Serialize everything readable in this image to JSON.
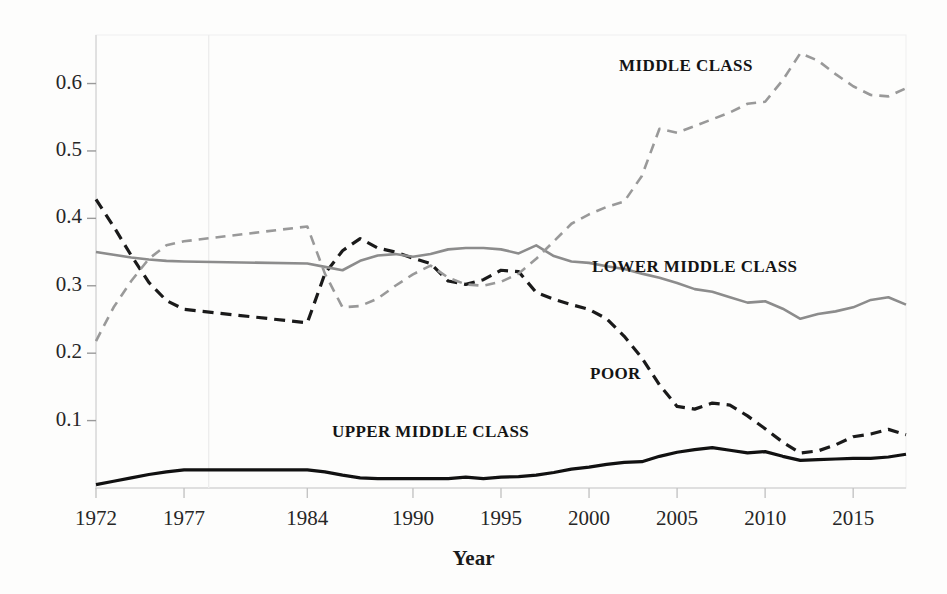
{
  "chart_data": {
    "type": "line",
    "title": "",
    "subtitle": "",
    "xlabel": "Year",
    "ylabel": "",
    "xlim": [
      1972,
      2018
    ],
    "ylim": [
      0.0,
      0.672
    ],
    "grid": false,
    "legend_position": "inline-annotations",
    "x_ticks": [
      1972,
      1977,
      1984,
      1990,
      1995,
      2000,
      2005,
      2010,
      2015
    ],
    "y_ticks": [
      0.1,
      0.2,
      0.3,
      0.4,
      0.5,
      0.6
    ],
    "y_tick_labels": [
      "0.1",
      "0.2",
      "0.3",
      "0.4",
      "0.5",
      "0.6"
    ],
    "x_tick_labels": [
      "1972",
      "1977",
      "1984",
      "1990",
      "1995",
      "2000",
      "2005",
      "2010",
      "2015"
    ],
    "annotations": [
      {
        "text": "MIDDLE CLASS",
        "x": 2005.5,
        "y": 0.625
      },
      {
        "text": "LOWER MIDDLE CLASS",
        "x": 2006.0,
        "y": 0.327
      },
      {
        "text": "POOR",
        "x": 2001.5,
        "y": 0.168
      },
      {
        "text": "UPPER MIDDLE CLASS",
        "x": 1991.0,
        "y": 0.082
      }
    ],
    "series": [
      {
        "name": "POOR",
        "color": "#1a1a1a",
        "style": "dashed",
        "width": 3.2,
        "x": [
          1972,
          1973,
          1974,
          1975,
          1976,
          1977,
          1984,
          1985,
          1986,
          1987,
          1988,
          1989,
          1990,
          1991,
          1992,
          1993,
          1994,
          1995,
          1996,
          1997,
          1998,
          1999,
          2000,
          2001,
          2002,
          2003,
          2004,
          2005,
          2006,
          2007,
          2008,
          2009,
          2010,
          2011,
          2012,
          2013,
          2014,
          2015,
          2016,
          2017,
          2018
        ],
        "values": [
          0.428,
          0.388,
          0.345,
          0.305,
          0.278,
          0.265,
          0.245,
          0.318,
          0.352,
          0.37,
          0.356,
          0.35,
          0.341,
          0.333,
          0.307,
          0.302,
          0.309,
          0.323,
          0.321,
          0.29,
          0.28,
          0.272,
          0.265,
          0.251,
          0.225,
          0.193,
          0.153,
          0.121,
          0.117,
          0.126,
          0.123,
          0.107,
          0.088,
          0.068,
          0.052,
          0.055,
          0.064,
          0.076,
          0.08,
          0.087,
          0.079
        ]
      },
      {
        "name": "LOWER MIDDLE CLASS",
        "color": "#8c8c8c",
        "style": "solid",
        "width": 2.6,
        "x": [
          1972,
          1973,
          1974,
          1975,
          1976,
          1977,
          1984,
          1985,
          1986,
          1987,
          1988,
          1989,
          1990,
          1991,
          1992,
          1993,
          1994,
          1995,
          1996,
          1997,
          1998,
          1999,
          2000,
          2001,
          2002,
          2003,
          2004,
          2005,
          2006,
          2007,
          2008,
          2009,
          2010,
          2011,
          2012,
          2013,
          2014,
          2015,
          2016,
          2017,
          2018
        ],
        "values": [
          0.35,
          0.346,
          0.342,
          0.339,
          0.337,
          0.336,
          0.333,
          0.328,
          0.323,
          0.337,
          0.345,
          0.347,
          0.343,
          0.347,
          0.354,
          0.356,
          0.356,
          0.354,
          0.348,
          0.36,
          0.344,
          0.336,
          0.334,
          0.329,
          0.325,
          0.318,
          0.312,
          0.304,
          0.295,
          0.291,
          0.283,
          0.275,
          0.277,
          0.266,
          0.251,
          0.258,
          0.262,
          0.268,
          0.279,
          0.283,
          0.272
        ]
      },
      {
        "name": "MIDDLE CLASS",
        "color": "#999999",
        "style": "dashed",
        "width": 2.6,
        "x": [
          1972,
          1973,
          1974,
          1975,
          1976,
          1977,
          1984,
          1985,
          1986,
          1987,
          1988,
          1989,
          1990,
          1991,
          1992,
          1993,
          1994,
          1995,
          1996,
          1997,
          1998,
          1999,
          2000,
          2001,
          2002,
          2003,
          2004,
          2005,
          2006,
          2007,
          2008,
          2009,
          2010,
          2011,
          2012,
          2013,
          2014,
          2015,
          2016,
          2017,
          2018
        ],
        "values": [
          0.218,
          0.268,
          0.307,
          0.34,
          0.36,
          0.366,
          0.388,
          0.318,
          0.268,
          0.27,
          0.281,
          0.3,
          0.317,
          0.33,
          0.312,
          0.302,
          0.3,
          0.306,
          0.318,
          0.34,
          0.366,
          0.392,
          0.406,
          0.417,
          0.425,
          0.463,
          0.533,
          0.527,
          0.537,
          0.547,
          0.557,
          0.57,
          0.573,
          0.605,
          0.645,
          0.634,
          0.614,
          0.596,
          0.583,
          0.581,
          0.593
        ]
      },
      {
        "name": "UPPER MIDDLE CLASS",
        "color": "#111111",
        "style": "solid",
        "width": 3.2,
        "x": [
          1972,
          1973,
          1974,
          1975,
          1976,
          1977,
          1984,
          1985,
          1986,
          1987,
          1988,
          1989,
          1990,
          1991,
          1992,
          1993,
          1994,
          1995,
          1996,
          1997,
          1998,
          1999,
          2000,
          2001,
          2002,
          2003,
          2004,
          2005,
          2006,
          2007,
          2008,
          2009,
          2010,
          2011,
          2012,
          2013,
          2014,
          2015,
          2016,
          2017,
          2018
        ],
        "values": [
          0.005,
          0.01,
          0.015,
          0.02,
          0.024,
          0.027,
          0.027,
          0.024,
          0.019,
          0.015,
          0.014,
          0.014,
          0.014,
          0.014,
          0.014,
          0.016,
          0.014,
          0.016,
          0.017,
          0.019,
          0.023,
          0.028,
          0.031,
          0.035,
          0.038,
          0.039,
          0.047,
          0.053,
          0.057,
          0.06,
          0.056,
          0.052,
          0.054,
          0.047,
          0.041,
          0.042,
          0.043,
          0.044,
          0.044,
          0.046,
          0.05
        ]
      }
    ]
  },
  "axis": {
    "y_title": "",
    "x_title": "Year"
  }
}
